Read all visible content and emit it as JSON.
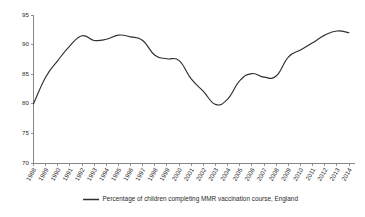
{
  "chart_data": {
    "type": "line",
    "title": "",
    "subtitle": "",
    "xlabel": "",
    "ylabel": "",
    "grid": false,
    "legend_position": "bottom",
    "ylim": [
      70,
      95
    ],
    "y_ticks": [
      70,
      75,
      80,
      85,
      90,
      95
    ],
    "y_tick_labels": [
      "70",
      "75",
      "80",
      "85",
      "90",
      "95"
    ],
    "categories": [
      "1988",
      "1989",
      "1990",
      "1991",
      "1992",
      "1993",
      "1994",
      "1995",
      "1996",
      "1997",
      "1998",
      "1999",
      "2000",
      "2001",
      "2002",
      "2003",
      "2004",
      "2005",
      "2006",
      "2007",
      "2008",
      "2009",
      "2010",
      "2011",
      "2012",
      "2013",
      "2014"
    ],
    "series": [
      {
        "name": "Percentage of children completing MMR vaccination course, England",
        "color": "#2f2f2f",
        "values": [
          80.0,
          84.5,
          87.3,
          89.8,
          91.5,
          90.7,
          90.9,
          91.6,
          91.3,
          90.7,
          88.2,
          87.6,
          87.3,
          84.2,
          82.1,
          79.9,
          80.8,
          83.9,
          85.1,
          84.5,
          84.7,
          87.9,
          89.1,
          90.3,
          91.6,
          92.3,
          92.0
        ]
      }
    ],
    "legend_entries": [
      {
        "label": "Percentage of children completing MMR vaccination course, England",
        "color": "#2f2f2f",
        "marker": "line"
      }
    ]
  },
  "figure": {
    "background_color": "#ffffff",
    "axis_color": "#7a7a7a",
    "text_color": "#2b2b2b"
  }
}
